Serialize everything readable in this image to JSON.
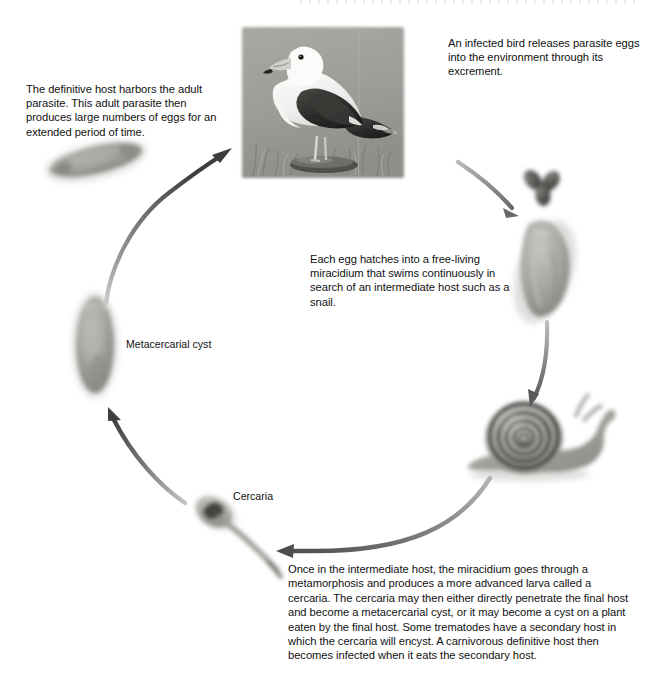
{
  "diagram": {
    "background_color": "#ffffff",
    "text_color": "#111111",
    "arrow_color": "#555555"
  },
  "captions": {
    "definitive_host": "The definitive host harbors the adult parasite. This adult parasite then produces large numbers of eggs for an extended period of time.",
    "infected_bird": "An infected bird releases parasite eggs into the environment through its excrement.",
    "egg_hatches": "Each egg hatches into a free-living miracidium that swims continuously in search of an intermediate host such as a snail.",
    "intermediate_host": "Once in the intermediate host, the miracidium goes through a metamorphosis and produces a more advanced larva called a cercaria. The cercaria may then either directly penetrate the final host and become a metacercarial cyst, or it may become a cyst on a plant eaten by the final host. Some trematodes have a secondary host in which the cercaria will encyst. A carnivorous definitive host then becomes infected when it eats the secondary host."
  },
  "labels": {
    "metacercarial_cyst": "Metacercarial cyst",
    "cercaria": "Cercaria"
  },
  "stages": [
    {
      "name": "adult-parasite",
      "icon": "adult-fluke-icon"
    },
    {
      "name": "definitive-host-bird",
      "icon": "seagull-photo-icon"
    },
    {
      "name": "parasite-eggs",
      "icon": "egg-cluster-icon"
    },
    {
      "name": "miracidium",
      "icon": "miracidium-icon"
    },
    {
      "name": "intermediate-host-snail",
      "icon": "snail-icon"
    },
    {
      "name": "cercaria",
      "icon": "cercaria-icon"
    },
    {
      "name": "metacercarial-cyst",
      "icon": "metacercarial-cyst-icon"
    }
  ],
  "arrows": [
    {
      "name": "arrow-cyst-to-bird",
      "from": "metacercarial-cyst",
      "to": "definitive-host-bird"
    },
    {
      "name": "arrow-bird-to-eggs",
      "from": "definitive-host-bird",
      "to": "parasite-eggs"
    },
    {
      "name": "arrow-miracidium-to-snail",
      "from": "miracidium",
      "to": "intermediate-host-snail"
    },
    {
      "name": "arrow-snail-to-cercaria",
      "from": "intermediate-host-snail",
      "to": "cercaria"
    },
    {
      "name": "arrow-cercaria-to-cyst",
      "from": "cercaria",
      "to": "metacercarial-cyst"
    }
  ]
}
